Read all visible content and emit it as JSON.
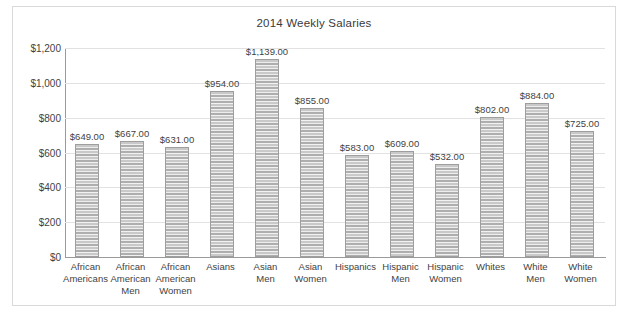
{
  "chart_data": {
    "type": "bar",
    "title": "2014 Weekly Salaries",
    "xlabel": "",
    "ylabel": "",
    "ylim": [
      0,
      1200
    ],
    "ytick_values": [
      0,
      200,
      400,
      600,
      800,
      1000,
      1200
    ],
    "ytick_labels": [
      "$0",
      "$200",
      "$400",
      "$600",
      "$800",
      "$1,000",
      "$1,200"
    ],
    "grid": true,
    "legend": false,
    "bar_color": "#b9b9b9",
    "categories": [
      "African Americans",
      "African American Men",
      "African American Women",
      "Asians",
      "Asian Men",
      "Asian Women",
      "Hispanics",
      "Hispanic Men",
      "Hispanic Women",
      "Whites",
      "White Men",
      "White Women"
    ],
    "category_lines": [
      [
        "African",
        "Americans"
      ],
      [
        "African",
        "American",
        "Men"
      ],
      [
        "African",
        "American",
        "Women"
      ],
      [
        "Asians"
      ],
      [
        "Asian",
        "Men"
      ],
      [
        "Asian",
        "Women"
      ],
      [
        "Hispanics"
      ],
      [
        "Hispanic",
        "Men"
      ],
      [
        "Hispanic",
        "Women"
      ],
      [
        "Whites"
      ],
      [
        "White",
        "Men"
      ],
      [
        "White",
        "Women"
      ]
    ],
    "values": [
      649,
      667,
      631,
      954,
      1139,
      855,
      583,
      609,
      532,
      802,
      884,
      725
    ],
    "data_labels": [
      "$649.00",
      "$667.00",
      "$631.00",
      "$954.00",
      "$1,139.00",
      "$855.00",
      "$583.00",
      "$609.00",
      "$532.00",
      "$802.00",
      "$884.00",
      "$725.00"
    ]
  }
}
